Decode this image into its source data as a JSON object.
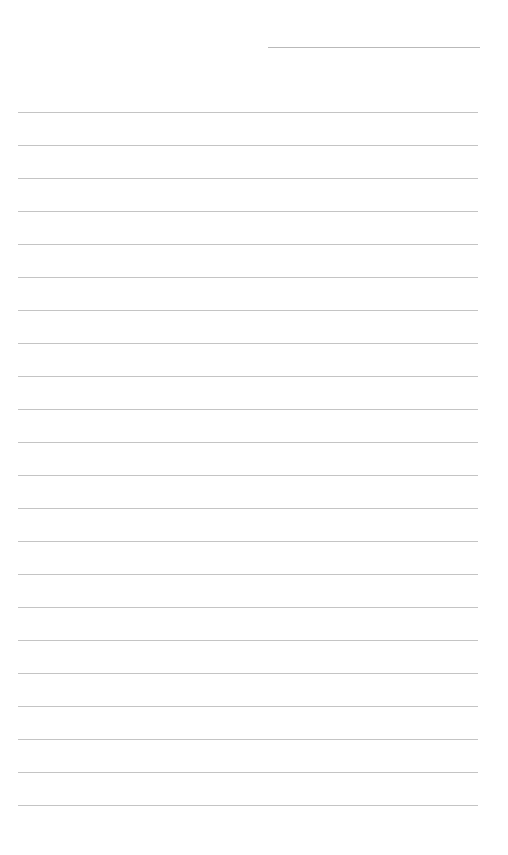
{
  "page": {
    "type": "blank-lined-sheet",
    "background": "#ffffff",
    "rule_color": "#c4c4c4",
    "header_rule": {
      "x": 268,
      "y": 47,
      "width": 212
    },
    "rules": {
      "x": 18,
      "width": 460,
      "ys": [
        112,
        145,
        178,
        211,
        244,
        277,
        310,
        343,
        376,
        409,
        442,
        475,
        508,
        541,
        574,
        607,
        640,
        673,
        706,
        739,
        772,
        805
      ]
    }
  }
}
